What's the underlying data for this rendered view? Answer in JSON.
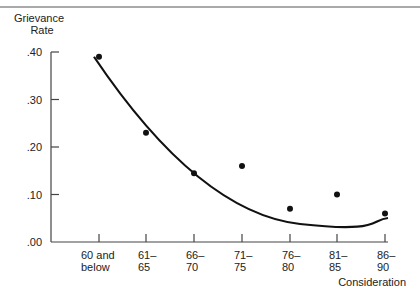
{
  "chart_data": {
    "type": "scatter",
    "title": "",
    "ylabel": "Grievance Rate",
    "ylabel_lines": [
      "Grievance",
      "Rate"
    ],
    "xlabel": "Consideration",
    "ylim": [
      0,
      0.4
    ],
    "y_ticks": [
      ".00",
      ".10",
      ".20",
      ".30",
      ".40"
    ],
    "categories": [
      "60 and below",
      "61–65",
      "66–70",
      "71–75",
      "76–80",
      "81–85",
      "86–90"
    ],
    "category_lines": [
      [
        "60 and",
        "below"
      ],
      [
        "61–",
        "65"
      ],
      [
        "66–",
        "70"
      ],
      [
        "71–",
        "75"
      ],
      [
        "76–",
        "80"
      ],
      [
        "81–",
        "85"
      ],
      [
        "86–",
        "90"
      ]
    ],
    "series": [
      {
        "name": "Observed",
        "type": "scatter",
        "values": [
          0.39,
          0.23,
          0.145,
          0.16,
          0.07,
          0.1,
          0.06
        ]
      },
      {
        "name": "Fitted curve",
        "type": "line",
        "values": [
          0.39,
          0.24,
          0.16,
          0.115,
          0.09,
          0.08,
          0.085
        ]
      }
    ],
    "grid": false,
    "legend": "none"
  }
}
